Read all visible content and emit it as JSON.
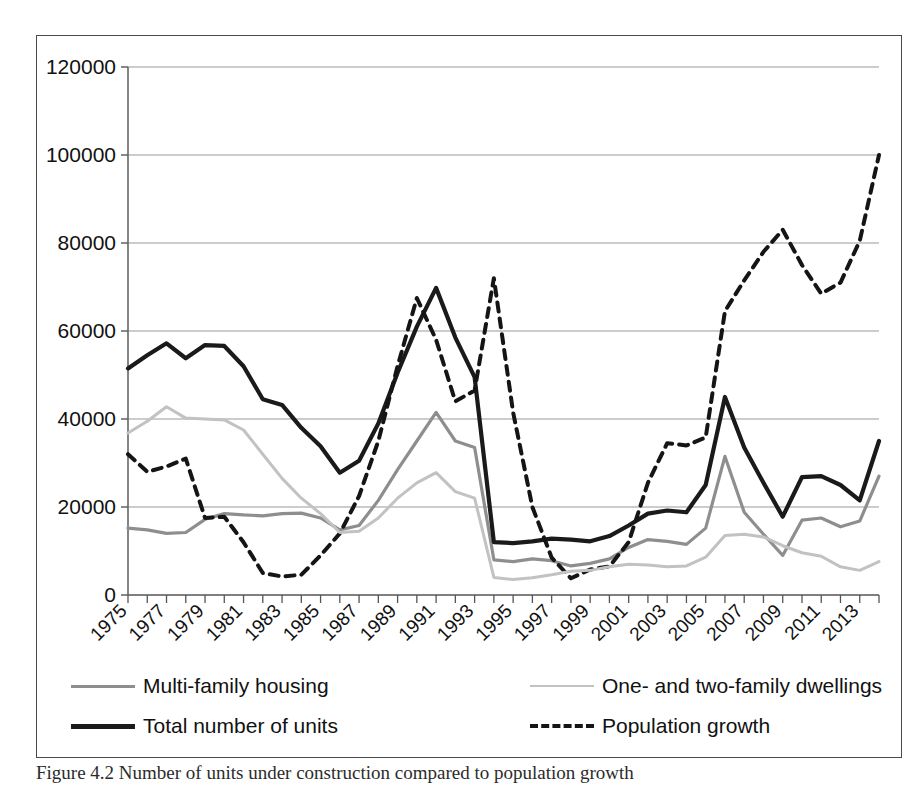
{
  "caption": "Figure 4.2 Number of units under construction compared to population growth",
  "legend": {
    "items": [
      {
        "label": "Multi-family housing",
        "style": "solid-mid",
        "color": "#8e8e8e"
      },
      {
        "label": "One- and two-family dwellings",
        "style": "solid-light",
        "color": "#c2c2c2"
      },
      {
        "label": "Total number of units",
        "style": "solid-dark",
        "color": "#1a1a1a"
      },
      {
        "label": "Population growth",
        "style": "dashed-dark",
        "color": "#151515"
      }
    ]
  },
  "chart_data": {
    "type": "line",
    "title": "",
    "xlabel": "",
    "ylabel": "",
    "ylim": [
      0,
      120000
    ],
    "ytick_labels": [
      "0",
      "20000",
      "40000",
      "60000",
      "80000",
      "100000",
      "120000"
    ],
    "yticks": [
      0,
      20000,
      40000,
      60000,
      80000,
      100000,
      120000
    ],
    "grid": true,
    "legend_position": "below-plot",
    "x": [
      1975,
      1976,
      1977,
      1978,
      1979,
      1980,
      1981,
      1982,
      1983,
      1984,
      1985,
      1986,
      1987,
      1988,
      1989,
      1990,
      1991,
      1992,
      1993,
      1994,
      1995,
      1996,
      1997,
      1998,
      1999,
      2000,
      2001,
      2002,
      2003,
      2004,
      2005,
      2006,
      2007,
      2008,
      2009,
      2010,
      2011,
      2012,
      2013,
      2014
    ],
    "xtick_labels": [
      "1975",
      "1977",
      "1979",
      "1981",
      "1983",
      "1985",
      "1987",
      "1989",
      "1991",
      "1993",
      "1995",
      "1997",
      "1999",
      "2001",
      "2003",
      "2005",
      "2007",
      "2009",
      "2011",
      "2013"
    ],
    "xtick_values": [
      1975,
      1977,
      1979,
      1981,
      1983,
      1985,
      1987,
      1989,
      1991,
      1993,
      1995,
      1997,
      1999,
      2001,
      2003,
      2005,
      2007,
      2009,
      2011,
      2013
    ],
    "xlim": [
      1975,
      2014
    ],
    "series": [
      {
        "name": "Total number of units",
        "color": "#1a1a1a",
        "dash": "none",
        "width": 4.2,
        "values": [
          51500,
          54500,
          57200,
          53800,
          56800,
          56600,
          52000,
          44500,
          43200,
          38000,
          33800,
          27800,
          30500,
          39000,
          50500,
          61000,
          69800,
          58500,
          49500,
          12000,
          11800,
          12200,
          12800,
          12600,
          12200,
          13400,
          15800,
          18500,
          19200,
          18800,
          25000,
          45000,
          33500,
          25500,
          17800,
          26800,
          27000,
          25000,
          21500,
          35000
        ]
      },
      {
        "name": "Multi-family housing",
        "color": "#8e8e8e",
        "dash": "none",
        "width": 3.2,
        "values": [
          15200,
          14800,
          14000,
          14200,
          17200,
          18500,
          18200,
          18000,
          18500,
          18600,
          17500,
          14800,
          15800,
          21500,
          28500,
          35000,
          41500,
          35000,
          33500,
          8000,
          7600,
          8200,
          7800,
          6600,
          7200,
          8200,
          10800,
          12600,
          12200,
          11500,
          15200,
          31500,
          18800,
          13800,
          9000,
          17000,
          17500,
          15500,
          16800,
          27000
        ]
      },
      {
        "name": "One- and two-family dwellings",
        "color": "#c2c2c2",
        "dash": "none",
        "width": 3.0,
        "values": [
          36800,
          39500,
          42800,
          40200,
          40000,
          39800,
          37500,
          32000,
          26500,
          22000,
          18500,
          14200,
          14500,
          17500,
          22000,
          25500,
          27800,
          23500,
          22000,
          4000,
          3500,
          3900,
          4600,
          5400,
          5600,
          6400,
          7000,
          6800,
          6400,
          6600,
          8600,
          13500,
          13800,
          13200,
          11200,
          9600,
          8800,
          6400,
          5600,
          7600
        ]
      },
      {
        "name": "Population growth",
        "color": "#151515",
        "dash": "dashed",
        "width": 4.0,
        "values": [
          32000,
          28000,
          29200,
          31000,
          17500,
          17800,
          12000,
          5000,
          4200,
          4600,
          9000,
          14000,
          22500,
          35000,
          52000,
          67500,
          58000,
          44000,
          46500,
          72000,
          41500,
          20000,
          8500,
          3800,
          5800,
          6500,
          12000,
          25500,
          34500,
          34000,
          35800,
          64500,
          71500,
          78000,
          83000,
          75000,
          68500,
          71000,
          80500,
          100000
        ]
      }
    ]
  }
}
